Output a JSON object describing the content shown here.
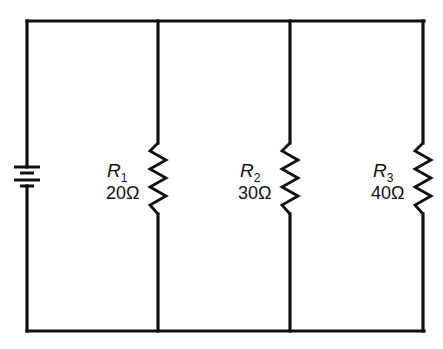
{
  "diagram": {
    "type": "parallel-circuit",
    "source": {
      "name": "battery",
      "symbol": "battery-icon"
    },
    "resistors": [
      {
        "name": "R",
        "subscript": "1",
        "value": "20Ω",
        "ohms": 20
      },
      {
        "name": "R",
        "subscript": "2",
        "value": "30Ω",
        "ohms": 30
      },
      {
        "name": "R",
        "subscript": "3",
        "value": "40Ω",
        "ohms": 40
      }
    ],
    "colors": {
      "line": "#111111",
      "background": "#ffffff"
    }
  }
}
